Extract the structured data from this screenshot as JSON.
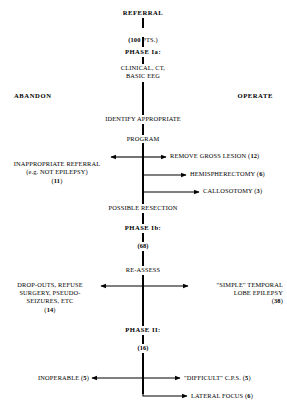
{
  "diagram": {
    "title_flow": "Epilepsy surgery patient selection flowchart",
    "spine": [
      {
        "id": "referral",
        "label": "REFERRAL",
        "style": "bold",
        "x": 150,
        "y": 13
      },
      {
        "id": "pts100",
        "label": "(100 PTS.)",
        "style": "mixed",
        "x": 150,
        "y": 32
      },
      {
        "id": "phase1a",
        "label": "PHASE Ia:",
        "style": "bold",
        "x": 150,
        "y": 52
      },
      {
        "id": "clinical",
        "label": "CLINICAL, CT,\nBASIC EEG",
        "style": "plain",
        "x": 150,
        "y": 68
      },
      {
        "id": "identify",
        "label": "IDENTIFY APPROPRIATE",
        "style": "plain",
        "x": 150,
        "y": 119
      },
      {
        "id": "program",
        "label": "PROGRAM",
        "style": "plain",
        "x": 150,
        "y": 139
      },
      {
        "id": "resection",
        "label": "POSSIBLE RESECTION",
        "style": "plain",
        "x": 150,
        "y": 208
      },
      {
        "id": "phase1b",
        "label": "PHASE Ib:",
        "style": "bold",
        "x": 150,
        "y": 228
      },
      {
        "id": "n68",
        "label": "(68)",
        "style": "bold",
        "x": 150,
        "y": 246
      },
      {
        "id": "reassess",
        "label": "RE-ASSESS",
        "style": "plain",
        "x": 150,
        "y": 270
      },
      {
        "id": "phase2",
        "label": "PHASE II:",
        "style": "bold",
        "x": 150,
        "y": 330
      },
      {
        "id": "n16",
        "label": "(16)",
        "style": "bold",
        "x": 150,
        "y": 348
      }
    ],
    "side_headers": [
      {
        "id": "abandon",
        "label": "ABANDON",
        "align": "left",
        "x": 14,
        "y": 96
      },
      {
        "id": "operate",
        "label": "OPERATE",
        "align": "right",
        "x": 273,
        "y": 96
      }
    ],
    "branches": [
      {
        "id": "inappropriate-referral",
        "label": "INAPPROPRIATE REFERRAL\n(e.g. NOT EPILEPSY)\n(11)",
        "side": "left",
        "count": "11",
        "y": 157
      },
      {
        "id": "remove-gross-lesion",
        "label": "REMOVE GROSS LESION (12)",
        "side": "right",
        "count": "12",
        "y": 157
      },
      {
        "id": "hemispherectomy",
        "label": "HEMISPHERECTOMY (6)",
        "side": "right",
        "count": "6",
        "y": 175
      },
      {
        "id": "callosotomy",
        "label": "CALLOSOTOMY (3)",
        "side": "right",
        "count": "3",
        "y": 192
      },
      {
        "id": "drop-outs",
        "label": "DROP-OUTS, REFUSE\nSURGERY, PSEUDO-\nSEIZURES, ETC\n(14)",
        "side": "left",
        "count": "14",
        "y": 286
      },
      {
        "id": "simple-temporal-lobe-epilepsy",
        "label": "\"SIMPLE\" TEMPORAL\nLOBE EPILEPSY\n(38)",
        "side": "right",
        "count": "38",
        "y": 286
      },
      {
        "id": "inoperable",
        "label": "INOPERABLE (5)",
        "side": "left",
        "count": "5",
        "y": 378
      },
      {
        "id": "difficult-cps",
        "label": "\"DIFFICULT\" C.P.S. (5)",
        "side": "right",
        "count": "5",
        "y": 378
      },
      {
        "id": "lateral-focus",
        "label": "LATERAL FOCUS (6)",
        "side": "right",
        "count": "6",
        "y": 396
      }
    ],
    "colors": {
      "ink": "#000000",
      "paper": "#ffffff"
    }
  }
}
